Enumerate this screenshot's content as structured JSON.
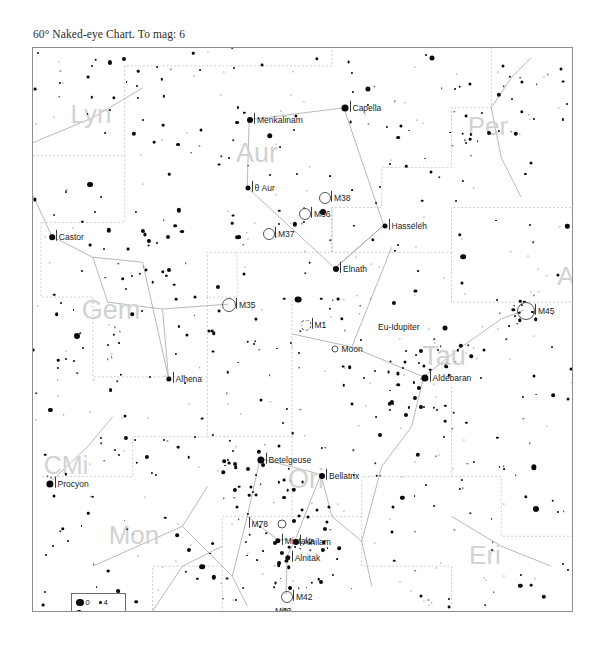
{
  "chart_title": "60° Naked-eye Chart. To mag: 6",
  "frame": {
    "x": 32,
    "y": 47,
    "w": 541,
    "h": 565
  },
  "legend": {
    "title_hidden": "",
    "rows": [
      {
        "mag_left": "0",
        "size_left": 7.5,
        "mag_right": "4",
        "size_right": 3
      },
      {
        "mag_left": "1",
        "size_left": 6.2,
        "mag_right": "5",
        "size_right": 2.2
      },
      {
        "mag_left": "2",
        "size_left": 5.0,
        "mag_right": "6",
        "size_right": 1.6
      },
      {
        "mag_left": "3",
        "size_left": 4.0,
        "mag_right": "7",
        "size_right": 1.2
      }
    ]
  },
  "constellations": [
    {
      "name": "Lyn",
      "x": 58,
      "y": 66,
      "size": 26
    },
    {
      "name": "Aur",
      "x": 224,
      "y": 105,
      "size": 27
    },
    {
      "name": "Per",
      "x": 455,
      "y": 78,
      "size": 26
    },
    {
      "name": "Gem",
      "x": 78,
      "y": 262,
      "size": 27
    },
    {
      "name": "Tau",
      "x": 411,
      "y": 308,
      "size": 27
    },
    {
      "name": "A",
      "x": 533,
      "y": 228,
      "size": 26
    },
    {
      "name": "CMi",
      "x": 33,
      "y": 417,
      "size": 25
    },
    {
      "name": "Ori",
      "x": 273,
      "y": 431,
      "size": 27
    },
    {
      "name": "Mon",
      "x": 101,
      "y": 487,
      "size": 26
    },
    {
      "name": "Eri",
      "x": 452,
      "y": 507,
      "size": 26
    }
  ],
  "named_stars": [
    {
      "name": "Capella",
      "x": 312,
      "y": 60,
      "mag_size": 7.0
    },
    {
      "name": "Menkalinam",
      "x": 217,
      "y": 72,
      "mag_size": 6.0
    },
    {
      "name": "θ Aur",
      "x": 215,
      "y": 140,
      "mag_size": 5.0
    },
    {
      "name": "Hasseleh",
      "x": 352,
      "y": 178,
      "mag_size": 5.0
    },
    {
      "name": "Castor",
      "x": 19,
      "y": 189,
      "mag_size": 5.6
    },
    {
      "name": "Elnath",
      "x": 303,
      "y": 221,
      "mag_size": 6.0
    },
    {
      "name": "Alhena",
      "x": 136,
      "y": 331,
      "mag_size": 5.2
    },
    {
      "name": "Aldebaran",
      "x": 392,
      "y": 330,
      "mag_size": 7.2
    },
    {
      "name": "Betelgeuse",
      "x": 228,
      "y": 412,
      "mag_size": 7.2
    },
    {
      "name": "Bellatrix",
      "x": 289,
      "y": 428,
      "mag_size": 6.0
    },
    {
      "name": "Procyon",
      "x": 17,
      "y": 436,
      "mag_size": 7.2
    },
    {
      "name": "Mintaka",
      "x": 245,
      "y": 493,
      "mag_size": 5.4
    },
    {
      "name": "Alnilam",
      "x": 263,
      "y": 494,
      "mag_size": 6.0
    },
    {
      "name": "Alnitak",
      "x": 255,
      "y": 510,
      "mag_size": 5.4
    }
  ],
  "deep_sky_objects": [
    {
      "name": "M38",
      "x": 292,
      "y": 150,
      "r": 6.0,
      "style": "circle"
    },
    {
      "name": "M36",
      "x": 272,
      "y": 166,
      "r": 6.0,
      "style": "circle"
    },
    {
      "name": "M37",
      "x": 236,
      "y": 186,
      "r": 6.0,
      "style": "circle"
    },
    {
      "name": "M45",
      "x": 493,
      "y": 263,
      "r": 9.0,
      "style": "circle"
    },
    {
      "name": "M35",
      "x": 196,
      "y": 257,
      "r": 7.0,
      "style": "circle"
    },
    {
      "name": "M1",
      "x": 273,
      "y": 277,
      "r": 5.5,
      "style": "dashed"
    },
    {
      "name": "Moon",
      "x": 302,
      "y": 301,
      "r": 3.5,
      "style": "circle"
    },
    {
      "name": "M78",
      "x": 249,
      "y": 476,
      "r": 4.5,
      "style": "circle"
    },
    {
      "name": "M42",
      "x": 254,
      "y": 549,
      "r": 6.0,
      "style": "circle"
    },
    {
      "name": "M43",
      "x": 252,
      "y": 563,
      "r": 3.0,
      "style": "circle"
    }
  ],
  "planet_labels": [
    {
      "name": "Eu-Idupiter",
      "x": 345,
      "y": 279
    }
  ],
  "chart_data": {
    "type": "scatter",
    "title": "60° Naked-eye Chart. To mag: 6",
    "xlabel": "",
    "ylabel": "",
    "field_of_view_deg": 60,
    "limiting_magnitude": 6,
    "legend_position": "bottom-left",
    "magnitude_scale": [
      "0",
      "1",
      "2",
      "3",
      "4",
      "5",
      "6",
      "7"
    ],
    "constellation_names": [
      "Lyn",
      "Aur",
      "Per",
      "Gem",
      "Tau",
      "A",
      "CMi",
      "Ori",
      "Mon",
      "Eri"
    ],
    "star_names": [
      "Capella",
      "Menkalinam",
      "θ Aur",
      "Hasseleh",
      "Castor",
      "Elnath",
      "Alhena",
      "Aldebaran",
      "Betelgeuse",
      "Bellatrix",
      "Procyon",
      "Mintaka",
      "Alnilam",
      "Alnitak"
    ],
    "dso_names": [
      "M38",
      "M36",
      "M37",
      "M45",
      "M35",
      "M1",
      "Moon",
      "M78",
      "M42",
      "M43"
    ],
    "solar_system_labels": [
      "Eu-Idupiter",
      "Moon"
    ]
  }
}
